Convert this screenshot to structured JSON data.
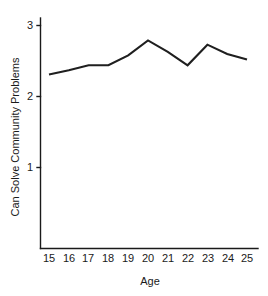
{
  "chart_data": {
    "type": "line",
    "title": "",
    "xlabel": "Age",
    "ylabel": "Can Solve Community Problems",
    "x": [
      15,
      16,
      17,
      18,
      19,
      20,
      21,
      22,
      23,
      24,
      25
    ],
    "values": [
      2.31,
      2.37,
      2.44,
      2.44,
      2.58,
      2.79,
      2.63,
      2.44,
      2.73,
      2.6,
      2.52
    ],
    "series": [
      {
        "name": "Can Solve Community Problems",
        "values": [
          2.31,
          2.37,
          2.44,
          2.44,
          2.58,
          2.79,
          2.63,
          2.44,
          2.73,
          2.6,
          2.52
        ]
      }
    ],
    "xtick_labels": [
      "15",
      "16",
      "17",
      "18",
      "19",
      "20",
      "21",
      "22",
      "23",
      "24",
      "25"
    ],
    "ytick_labels": [
      "1",
      "2",
      "3"
    ],
    "ytick_values": [
      1,
      2,
      3
    ],
    "xlim": [
      15,
      25
    ],
    "ylim": [
      0,
      3.15
    ],
    "grid": false,
    "legend": false,
    "markers": false,
    "line_color": "#1f1f1f",
    "background_color": "#ffffff"
  }
}
